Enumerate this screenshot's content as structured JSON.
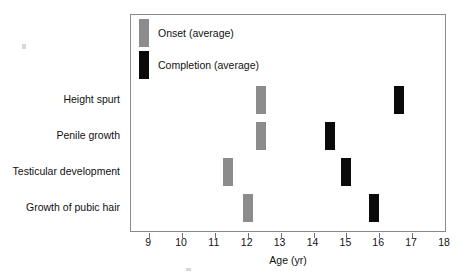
{
  "chart_data": {
    "type": "bar",
    "orientation": "horizontal-markers",
    "title": "",
    "xlabel": "Age (yr)",
    "ylabel": "",
    "xlim": [
      8.45,
      18.0
    ],
    "xticks": [
      9,
      10,
      11,
      12,
      13,
      14,
      15,
      16,
      17,
      18
    ],
    "xtick_labels": [
      "9",
      "10",
      "11",
      "12",
      "13",
      "14",
      "15",
      "16",
      "17",
      "18"
    ],
    "grid": false,
    "legend_position": "top-left",
    "categories": [
      "Height spurt",
      "Penile growth",
      "Testicular development",
      "Growth of pubic hair"
    ],
    "series": [
      {
        "name": "Onset (average)",
        "color": "#8c8c8c",
        "values": [
          12.4,
          12.4,
          11.4,
          12.0
        ]
      },
      {
        "name": "Completion (average)",
        "color": "#0a0a0a",
        "values": [
          16.6,
          14.5,
          15.0,
          15.85
        ]
      }
    ]
  },
  "legend": {
    "items": [
      {
        "label": "Onset (average)",
        "color": "#8c8c8c"
      },
      {
        "label": "Completion (average)",
        "color": "#0a0a0a"
      }
    ]
  },
  "axis": {
    "title": "Age (yr)"
  }
}
